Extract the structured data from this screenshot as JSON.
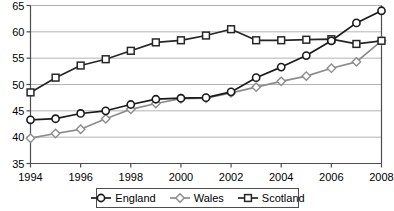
{
  "chart_data": {
    "type": "line",
    "title": "",
    "xlabel": "",
    "ylabel": "",
    "xlim": [
      1994,
      2008
    ],
    "ylim": [
      35,
      65
    ],
    "ygrid": true,
    "xgrid": false,
    "ytick_step": 5,
    "xtick_step": 2,
    "ytick_labels": [
      "35",
      "40",
      "45",
      "50",
      "55",
      "60",
      "65"
    ],
    "ytick_values": [
      35,
      40,
      45,
      50,
      55,
      60,
      65
    ],
    "xtick_labels": [
      "1994",
      "1996",
      "1998",
      "2000",
      "2002",
      "2004",
      "2006",
      "2008"
    ],
    "xtick_values": [
      1994,
      1996,
      1998,
      2000,
      2002,
      2004,
      2006,
      2008
    ],
    "x": [
      1994,
      1995,
      1996,
      1997,
      1998,
      1999,
      2000,
      2001,
      2002,
      2003,
      2004,
      2005,
      2006,
      2007,
      2008
    ],
    "legend_position": "bottom",
    "series": [
      {
        "name": "England",
        "marker": "circle",
        "color": "#1a1a1a",
        "values": [
          43.3,
          43.5,
          44.5,
          45.0,
          46.2,
          47.2,
          47.4,
          47.5,
          48.6,
          51.3,
          53.3,
          55.5,
          58.3,
          61.7,
          64.0
        ]
      },
      {
        "name": "Wales",
        "marker": "diamond",
        "color": "#8c8c8c",
        "values": [
          39.8,
          40.7,
          41.5,
          43.5,
          45.3,
          46.4,
          47.3,
          47.4,
          48.4,
          49.5,
          50.6,
          51.6,
          53.1,
          54.3,
          58.3
        ]
      },
      {
        "name": "Scotland",
        "marker": "square",
        "color": "#262626",
        "values": [
          48.5,
          51.3,
          53.6,
          54.8,
          56.4,
          58.0,
          58.4,
          59.3,
          60.5,
          58.4,
          58.4,
          58.5,
          58.6,
          57.7,
          58.3
        ]
      }
    ]
  },
  "legend": {
    "items": [
      {
        "label": "England",
        "marker": "circle-marker-icon"
      },
      {
        "label": "Wales",
        "marker": "diamond-marker-icon"
      },
      {
        "label": "Scotland",
        "marker": "square-marker-icon"
      }
    ]
  },
  "colors": {
    "england": "#1a1a1a",
    "wales": "#8c8c8c",
    "scotland": "#262626",
    "grid": "#b3b3b3",
    "axis": "#4d4d4d",
    "marker_fill": "#ffffff"
  }
}
